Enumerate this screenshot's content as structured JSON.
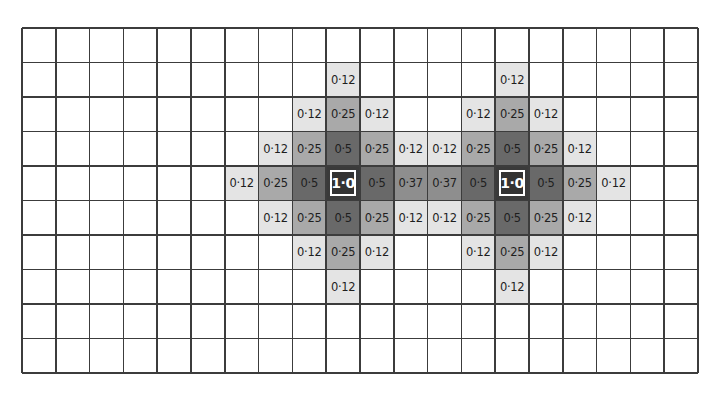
{
  "diagram": {
    "title": "",
    "grid": {
      "columns": 20,
      "rows": 10
    },
    "colors": {
      "0·12": "#e4e4e4",
      "0·25": "#a9a9a9",
      "0·37": "#8e8e8e",
      "0·5": "#696969",
      "1·0": "#3a3a3a"
    },
    "sources": [
      {
        "row": 4,
        "col": 9,
        "label": "1·0"
      },
      {
        "row": 4,
        "col": 14,
        "label": "1·0"
      }
    ],
    "cells": [
      {
        "row": 1,
        "col": 9,
        "label": "0·12"
      },
      {
        "row": 1,
        "col": 14,
        "label": "0·12"
      },
      {
        "row": 2,
        "col": 8,
        "label": "0·12"
      },
      {
        "row": 2,
        "col": 9,
        "label": "0·25"
      },
      {
        "row": 2,
        "col": 10,
        "label": "0·12"
      },
      {
        "row": 2,
        "col": 13,
        "label": "0·12"
      },
      {
        "row": 2,
        "col": 14,
        "label": "0·25"
      },
      {
        "row": 2,
        "col": 15,
        "label": "0·12"
      },
      {
        "row": 3,
        "col": 7,
        "label": "0·12"
      },
      {
        "row": 3,
        "col": 8,
        "label": "0·25"
      },
      {
        "row": 3,
        "col": 9,
        "label": "0·5"
      },
      {
        "row": 3,
        "col": 10,
        "label": "0·25"
      },
      {
        "row": 3,
        "col": 11,
        "label": "0·12"
      },
      {
        "row": 3,
        "col": 12,
        "label": "0·12"
      },
      {
        "row": 3,
        "col": 13,
        "label": "0·25"
      },
      {
        "row": 3,
        "col": 14,
        "label": "0·5"
      },
      {
        "row": 3,
        "col": 15,
        "label": "0·25"
      },
      {
        "row": 3,
        "col": 16,
        "label": "0·12"
      },
      {
        "row": 4,
        "col": 6,
        "label": "0·12"
      },
      {
        "row": 4,
        "col": 7,
        "label": "0·25"
      },
      {
        "row": 4,
        "col": 8,
        "label": "0·5"
      },
      {
        "row": 4,
        "col": 9,
        "label": "1·0"
      },
      {
        "row": 4,
        "col": 10,
        "label": "0·5"
      },
      {
        "row": 4,
        "col": 11,
        "label": "0·37"
      },
      {
        "row": 4,
        "col": 12,
        "label": "0·37"
      },
      {
        "row": 4,
        "col": 13,
        "label": "0·5"
      },
      {
        "row": 4,
        "col": 14,
        "label": "1·0"
      },
      {
        "row": 4,
        "col": 15,
        "label": "0·5"
      },
      {
        "row": 4,
        "col": 16,
        "label": "0·25"
      },
      {
        "row": 4,
        "col": 17,
        "label": "0·12"
      },
      {
        "row": 5,
        "col": 7,
        "label": "0·12"
      },
      {
        "row": 5,
        "col": 8,
        "label": "0·25"
      },
      {
        "row": 5,
        "col": 9,
        "label": "0·5"
      },
      {
        "row": 5,
        "col": 10,
        "label": "0·25"
      },
      {
        "row": 5,
        "col": 11,
        "label": "0·12"
      },
      {
        "row": 5,
        "col": 12,
        "label": "0·12"
      },
      {
        "row": 5,
        "col": 13,
        "label": "0·25"
      },
      {
        "row": 5,
        "col": 14,
        "label": "0·5"
      },
      {
        "row": 5,
        "col": 15,
        "label": "0·25"
      },
      {
        "row": 5,
        "col": 16,
        "label": "0·12"
      },
      {
        "row": 6,
        "col": 8,
        "label": "0·12"
      },
      {
        "row": 6,
        "col": 9,
        "label": "0·25"
      },
      {
        "row": 6,
        "col": 10,
        "label": "0·12"
      },
      {
        "row": 6,
        "col": 13,
        "label": "0·12"
      },
      {
        "row": 6,
        "col": 14,
        "label": "0·25"
      },
      {
        "row": 6,
        "col": 15,
        "label": "0·12"
      },
      {
        "row": 7,
        "col": 9,
        "label": "0·12"
      },
      {
        "row": 7,
        "col": 14,
        "label": "0·12"
      }
    ]
  }
}
